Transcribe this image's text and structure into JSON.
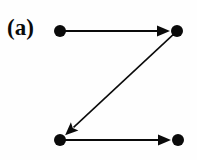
{
  "figure": {
    "panel_label": "(a)",
    "background_color": "#fefefe",
    "ink_color": "#0a0a0a",
    "width": 197,
    "height": 160
  },
  "chart_data": {
    "type": "diagram",
    "diagram_kind": "directed-graph",
    "title": "(a)",
    "nodes": [
      {
        "id": "n1",
        "label": "",
        "x": 60,
        "y": 31,
        "radius": 6,
        "fill": "#0a0a0a",
        "position": "top-left"
      },
      {
        "id": "n2",
        "label": "",
        "x": 177,
        "y": 31,
        "radius": 6,
        "fill": "#0a0a0a",
        "position": "top-right"
      },
      {
        "id": "n3",
        "label": "",
        "x": 60,
        "y": 140,
        "radius": 6,
        "fill": "#0a0a0a",
        "position": "bottom-left"
      },
      {
        "id": "n4",
        "label": "",
        "x": 178,
        "y": 140,
        "radius": 6,
        "fill": "#0a0a0a",
        "position": "bottom-right"
      }
    ],
    "edges": [
      {
        "id": "e1",
        "from": "n1",
        "to": "n2",
        "directed": true,
        "label": "",
        "orientation": "horizontal-right",
        "x1": 64,
        "y1": 31,
        "x2": 170,
        "y2": 31
      },
      {
        "id": "e2",
        "from": "n2",
        "to": "n3",
        "directed": true,
        "label": "",
        "orientation": "diagonal-down-left",
        "x1": 173,
        "y1": 35,
        "x2": 67,
        "y2": 134
      },
      {
        "id": "e3",
        "from": "n3",
        "to": "n4",
        "directed": true,
        "label": "",
        "orientation": "horizontal-right",
        "x1": 64,
        "y1": 140,
        "x2": 171,
        "y2": 140
      }
    ],
    "edge_style": {
      "stroke": "#0a0a0a",
      "stroke_width": 1.8,
      "arrowhead_length": 13,
      "arrowhead_width": 11
    },
    "legend": [],
    "annotations": [
      "(a)"
    ],
    "grid": false
  }
}
